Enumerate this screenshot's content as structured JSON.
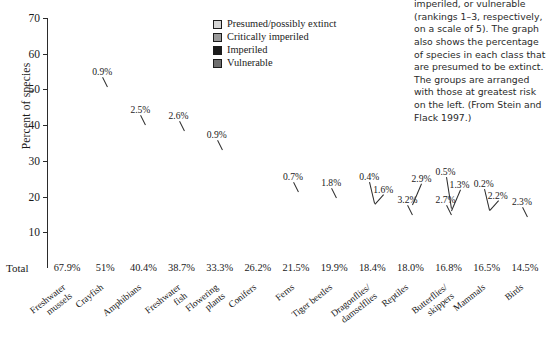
{
  "chart_data": {
    "type": "bar",
    "subtype": "stacked-bar",
    "title": "",
    "xlabel": "",
    "ylabel": "Percent of species",
    "ylim": [
      0,
      70
    ],
    "yticks": [
      10,
      20,
      30,
      40,
      50,
      60,
      70
    ],
    "grid": false,
    "legend_position": "top-center-right",
    "stack_order_bottom_to_top": [
      "Vulnerable",
      "Imperiled",
      "Critically imperiled",
      "Presumed/possibly extinct"
    ],
    "categories": [
      "Freshwater\nmussels",
      "Crayfish",
      "Amphibians",
      "Freshwater\nfish",
      "Flowering\nplants",
      "Conifers",
      "Ferns",
      "Tiger beetles",
      "Dragonflies/\ndamselflies",
      "Reptiles",
      "Butterflies/\nskippers",
      "Mammals",
      "Birds"
    ],
    "series": [
      {
        "name": "Vulnerable",
        "color": "#6e6e6e",
        "values": [
          16.4,
          17.3,
          14.0,
          14.1,
          16.6,
          12.2,
          11.9,
          13.6,
          10.4,
          11.9,
          12.3,
          9.1,
          5.4
        ],
        "labels": [
          "16.4%",
          "17.3%",
          "14.0%",
          "14.1%",
          "16.6%",
          "12.2%",
          "11.9%",
          "13.6%",
          "10.4%",
          "11.9%",
          "12.3%",
          "9.1%",
          "5.4%"
        ]
      },
      {
        "name": "Imperiled",
        "color": "#1c1c1c",
        "values": [
          14.8,
          15.2,
          10.3,
          10.7,
          9.5,
          7.0,
          4.0,
          0.0,
          6.0,
          3.2,
          2.7,
          5.0,
          3.5
        ],
        "labels": [
          "14.8%",
          "15.2%",
          "10.3%",
          "10.7%",
          "9.5%",
          "7.0%",
          "4.0%",
          "",
          "6.0%",
          "3.2%",
          "2.7%",
          "5.0%",
          "3.5%"
        ]
      },
      {
        "name": "Critically imperiled",
        "color": "#999999",
        "values": [
          24.9,
          17.6,
          13.6,
          11.3,
          6.3,
          7.0,
          4.9,
          4.5,
          1.6,
          2.9,
          1.3,
          2.2,
          3.3
        ],
        "labels": [
          "24.9%",
          "17.6%",
          "13.6%",
          "11.3%",
          "6.3%",
          "7.0%",
          "4.9%",
          "4.5%",
          "1.6%",
          "2.9%",
          "1.3%",
          "2.2%",
          "3.3%"
        ]
      },
      {
        "name": "Presumed/possibly extinct",
        "color": "#d4d4d4",
        "values": [
          11.8,
          0.9,
          2.5,
          2.6,
          0.9,
          0.0,
          0.7,
          1.8,
          0.4,
          0.0,
          0.5,
          0.2,
          2.3
        ],
        "labels": [
          "11.8%",
          "0.9%",
          "2.5%",
          "2.6%",
          "0.9%",
          "",
          "0.7%",
          "1.8%",
          "0.4%",
          "",
          "0.5%",
          "0.2%",
          "2.3%"
        ]
      }
    ],
    "totals_row_label": "Total",
    "totals": [
      "67.9%",
      "51%",
      "40.4%",
      "38.7%",
      "33.3%",
      "26.2%",
      "21.5%",
      "19.9%",
      "18.4%",
      "18.0%",
      "16.8%",
      "16.5%",
      "14.5%"
    ]
  },
  "legend": {
    "items": [
      {
        "label": "Presumed/possibly extinct",
        "color": "#d4d4d4"
      },
      {
        "label": "Critically imperiled",
        "color": "#999999"
      },
      {
        "label": "Imperiled",
        "color": "#1c1c1c"
      },
      {
        "label": "Vulnerable",
        "color": "#6e6e6e"
      }
    ]
  },
  "caption": {
    "text": "imperiled, or vulnerable (rankings 1–3, respectively, on a scale of 5). The graph also shows the percentage of species in each class that are presumed to be extinct. The groups are arranged with those at greatest risk on the left. (From Stein and Flack 1997.)"
  },
  "axis": {
    "y_title": "Percent of species",
    "y_tick_labels": [
      "10",
      "20",
      "30",
      "40",
      "50",
      "60",
      "70"
    ]
  }
}
